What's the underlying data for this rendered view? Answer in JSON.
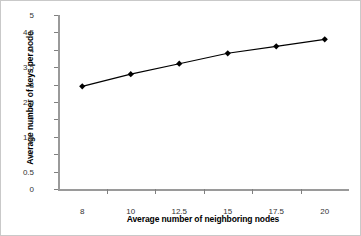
{
  "chart_data": {
    "type": "line",
    "title": "",
    "xlabel": "Average number of neighboring nodes",
    "ylabel": "Average number of keys per node",
    "categories": [
      "8",
      "10",
      "12.5",
      "15",
      "17.5",
      "20"
    ],
    "x": [
      8,
      10,
      12.5,
      15,
      17.5,
      20
    ],
    "values": [
      2.95,
      3.3,
      3.6,
      3.9,
      4.1,
      4.3
    ],
    "series": [
      {
        "name": "Average number of keys per node",
        "values": [
          2.95,
          3.3,
          3.6,
          3.9,
          4.1,
          4.3
        ]
      }
    ],
    "ylim": [
      0,
      5
    ],
    "ytick_labels": [
      "0",
      "0.5",
      "1",
      "1.5",
      "2",
      "2.5",
      "3",
      "3.5",
      "4",
      "4.5",
      "5"
    ],
    "ytick_values": [
      0,
      0.5,
      1,
      1.5,
      2,
      2.5,
      3,
      3.5,
      4,
      4.5,
      5
    ],
    "xtick_labels": [
      "8",
      "10",
      "12.5",
      "15",
      "17.5",
      "20"
    ],
    "grid": false,
    "legend": false,
    "legend_position": "none",
    "marker": "diamond",
    "colors": {
      "line": "#000000",
      "marker": "#000000",
      "axis": "#9a9a9a",
      "tick_label": "#333333",
      "background": "#ffffff",
      "border": "#c9c9c9"
    }
  },
  "axes": {
    "y_title": "Average number of keys per node",
    "x_title": "Average number of neighboring nodes"
  }
}
